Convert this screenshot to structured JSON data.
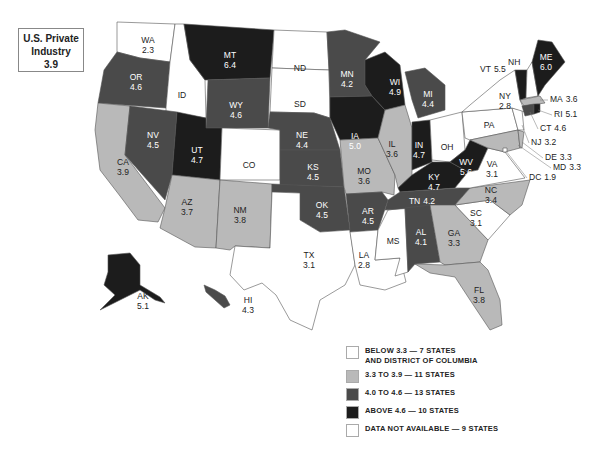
{
  "title": {
    "line1": "U.S. Private",
    "line2": "Industry",
    "value": "3.9"
  },
  "colors": {
    "below": "#ffffff",
    "low": "#b9b9b9",
    "mid": "#4a4a4a",
    "high": "#1c1c1c",
    "na": "#ffffff"
  },
  "legend": [
    {
      "key": "below",
      "label_line1": "BELOW 3.3 — 7 STATES",
      "label_line2": "AND DISTRICT OF COLUMBIA"
    },
    {
      "key": "low",
      "label_line1": "3.3  TO 3.9 — 11 STATES",
      "label_line2": ""
    },
    {
      "key": "mid",
      "label_line1": "4.0 TO 4.6 — 13 STATES",
      "label_line2": ""
    },
    {
      "key": "high",
      "label_line1": "ABOVE 4.6 — 10 STATES",
      "label_line2": ""
    },
    {
      "key": "na",
      "label_line1": "DATA NOT AVAILABLE — 9 STATES",
      "label_line2": ""
    }
  ],
  "states": {
    "WA": {
      "abbr": "WA",
      "value": "2.3",
      "cat": "below"
    },
    "OR": {
      "abbr": "OR",
      "value": "4.6",
      "cat": "mid"
    },
    "CA": {
      "abbr": "CA",
      "value": "3.9",
      "cat": "low"
    },
    "ID": {
      "abbr": "ID",
      "value": "",
      "cat": "na"
    },
    "NV": {
      "abbr": "NV",
      "value": "4.5",
      "cat": "mid"
    },
    "MT": {
      "abbr": "MT",
      "value": "6.4",
      "cat": "high"
    },
    "WY": {
      "abbr": "WY",
      "value": "4.6",
      "cat": "mid"
    },
    "UT": {
      "abbr": "UT",
      "value": "4.7",
      "cat": "high"
    },
    "AZ": {
      "abbr": "AZ",
      "value": "3.7",
      "cat": "low"
    },
    "CO": {
      "abbr": "CO",
      "value": "",
      "cat": "na"
    },
    "NM": {
      "abbr": "NM",
      "value": "3.8",
      "cat": "low"
    },
    "ND": {
      "abbr": "ND",
      "value": "",
      "cat": "na"
    },
    "SD": {
      "abbr": "SD",
      "value": "",
      "cat": "na"
    },
    "NE": {
      "abbr": "NE",
      "value": "4.4",
      "cat": "mid"
    },
    "KS": {
      "abbr": "KS",
      "value": "4.5",
      "cat": "mid"
    },
    "OK": {
      "abbr": "OK",
      "value": "4.5",
      "cat": "mid"
    },
    "TX": {
      "abbr": "TX",
      "value": "3.1",
      "cat": "below"
    },
    "MN": {
      "abbr": "MN",
      "value": "4.2",
      "cat": "mid"
    },
    "IA": {
      "abbr": "IA",
      "value": "5.0",
      "cat": "high"
    },
    "MO": {
      "abbr": "MO",
      "value": "3.6",
      "cat": "low"
    },
    "AR": {
      "abbr": "AR",
      "value": "4.5",
      "cat": "mid"
    },
    "LA": {
      "abbr": "LA",
      "value": "2.8",
      "cat": "below"
    },
    "WI": {
      "abbr": "WI",
      "value": "4.9",
      "cat": "high"
    },
    "IL": {
      "abbr": "IL",
      "value": "3.6",
      "cat": "low"
    },
    "MS": {
      "abbr": "MS",
      "value": "",
      "cat": "na"
    },
    "MI": {
      "abbr": "MI",
      "value": "4.4",
      "cat": "mid"
    },
    "IN": {
      "abbr": "IN",
      "value": "4.7",
      "cat": "high"
    },
    "KY": {
      "abbr": "KY",
      "value": "4.7",
      "cat": "high"
    },
    "TN": {
      "abbr": "TN",
      "value": "4.2",
      "cat": "mid"
    },
    "AL": {
      "abbr": "AL",
      "value": "4.1",
      "cat": "mid"
    },
    "OH": {
      "abbr": "OH",
      "value": "",
      "cat": "na"
    },
    "WV": {
      "abbr": "WV",
      "value": "5.6",
      "cat": "high"
    },
    "VA": {
      "abbr": "VA",
      "value": "3.1",
      "cat": "below"
    },
    "NC": {
      "abbr": "NC",
      "value": "3.4",
      "cat": "low"
    },
    "SC": {
      "abbr": "SC",
      "value": "3.1",
      "cat": "below"
    },
    "GA": {
      "abbr": "GA",
      "value": "3.3",
      "cat": "low"
    },
    "FL": {
      "abbr": "FL",
      "value": "3.8",
      "cat": "low"
    },
    "PA": {
      "abbr": "PA",
      "value": "",
      "cat": "na"
    },
    "NY": {
      "abbr": "NY",
      "value": "2.8",
      "cat": "below"
    },
    "VT": {
      "abbr": "VT",
      "value": "5.5",
      "cat": "high"
    },
    "NH": {
      "abbr": "NH",
      "value": "",
      "cat": "na"
    },
    "ME": {
      "abbr": "ME",
      "value": "6.0",
      "cat": "high"
    },
    "MA": {
      "abbr": "MA",
      "value": "3.6",
      "cat": "low"
    },
    "RI": {
      "abbr": "RI",
      "value": "5.1",
      "cat": "high"
    },
    "CT": {
      "abbr": "CT",
      "value": "4.6",
      "cat": "mid"
    },
    "NJ": {
      "abbr": "NJ",
      "value": "3.2",
      "cat": "below"
    },
    "DE": {
      "abbr": "DE",
      "value": "3.3",
      "cat": "low"
    },
    "MD": {
      "abbr": "MD",
      "value": "3.3",
      "cat": "low"
    },
    "DC": {
      "abbr": "DC",
      "value": "1.9",
      "cat": "below"
    },
    "AK": {
      "abbr": "AK",
      "value": "5.1",
      "cat": "high"
    },
    "HI": {
      "abbr": "HI",
      "value": "4.3",
      "cat": "mid"
    }
  }
}
